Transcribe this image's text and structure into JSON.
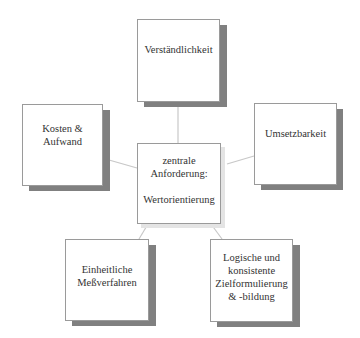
{
  "diagram": {
    "center": {
      "label": "zentrale\nAnforderung:\n\nWertorientierung"
    },
    "nodes": [
      {
        "id": "top",
        "label": "Verständlichkeit"
      },
      {
        "id": "left",
        "label": "Kosten &\nAufwand"
      },
      {
        "id": "right",
        "label": "Umsetzbarkeit"
      },
      {
        "id": "bottom-left",
        "label": "Einheitliche\nMeßverfahren"
      },
      {
        "id": "bottom-right",
        "label": "Logische und\nkonsistente\nZielformulierung\n& -bildung"
      }
    ],
    "colors": {
      "shadow": "#808080",
      "border": "#9a9a9a",
      "connector": "#c8c8c8"
    }
  }
}
